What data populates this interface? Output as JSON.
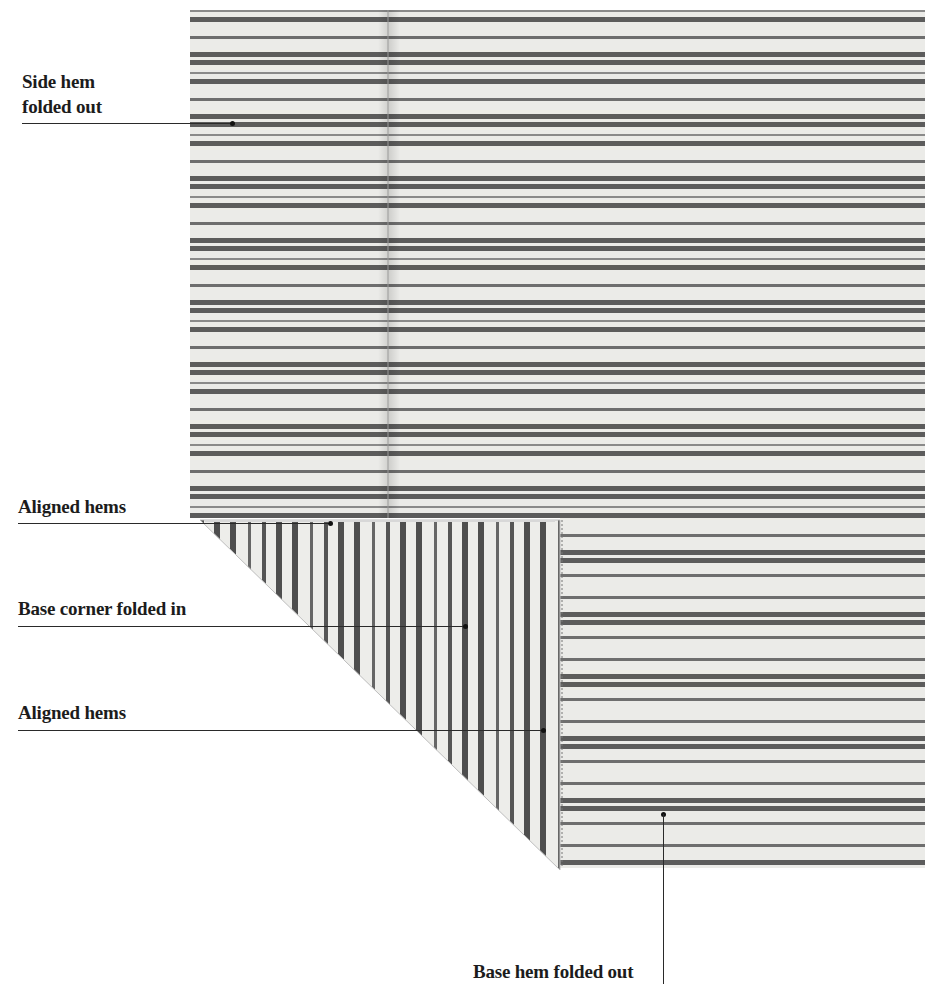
{
  "figure": {
    "colors": {
      "background": "#ffffff",
      "fabric_ground": "#ebebe8",
      "fabric_stripe": "#5c5c5c",
      "fabric_stripe_light": "#8a8a8a",
      "label_text": "#1c1c1c",
      "leader_line": "#2a2a2a"
    }
  },
  "labels": [
    {
      "id": "side-hem",
      "lines": [
        "Side hem",
        "folded out"
      ]
    },
    {
      "id": "aligned-hems-top",
      "lines": [
        "Aligned hems"
      ]
    },
    {
      "id": "base-corner",
      "lines": [
        "Base corner folded in"
      ]
    },
    {
      "id": "aligned-hems-bottom",
      "lines": [
        "Aligned hems"
      ]
    },
    {
      "id": "base-hem",
      "lines": [
        "Base hem folded out"
      ]
    }
  ]
}
